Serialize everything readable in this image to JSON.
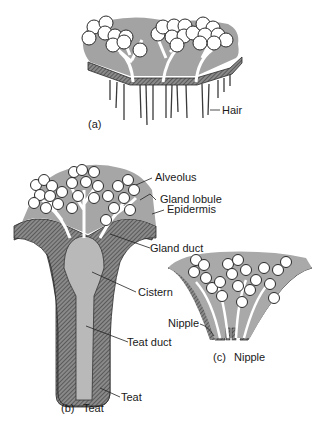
{
  "colors": {
    "gland_tissue": "#a9a9a9",
    "skin_dark": "#6e6e6e",
    "cistern": "#b8b8b8",
    "alveolus": "#ffffff",
    "outline": "#2a2a2a",
    "background": "#ffffff"
  },
  "panels": [
    {
      "id": "a",
      "caption": "(a)",
      "title": "",
      "labels": [
        {
          "text": "Hair"
        }
      ]
    },
    {
      "id": "b",
      "caption": "(b)",
      "title": "Teat",
      "labels": [
        {
          "text": "Alveolus"
        },
        {
          "text": "Gland lobule"
        },
        {
          "text": "Epidermis"
        },
        {
          "text": "Gland duct"
        },
        {
          "text": "Cistern"
        },
        {
          "text": "Teat duct"
        },
        {
          "text": "Teat"
        }
      ]
    },
    {
      "id": "c",
      "caption": "(c)",
      "title": "Nipple",
      "labels": [
        {
          "text": "Nipple"
        }
      ]
    }
  ]
}
